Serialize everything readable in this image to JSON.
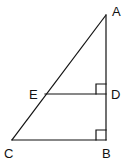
{
  "diagram": {
    "type": "geometry",
    "stroke_color": "#111111",
    "background_color": "#ffffff",
    "points": {
      "A": {
        "label": "A",
        "x": 106,
        "y": 15
      },
      "B": {
        "label": "B",
        "x": 106,
        "y": 140
      },
      "C": {
        "label": "C",
        "x": 12,
        "y": 140
      },
      "D": {
        "label": "D",
        "x": 106,
        "y": 94
      },
      "E": {
        "label": "E",
        "x": 45,
        "y": 94
      }
    },
    "segments": [
      {
        "from": "A",
        "to": "C"
      },
      {
        "from": "A",
        "to": "B"
      },
      {
        "from": "C",
        "to": "B"
      },
      {
        "from": "E",
        "to": "D"
      }
    ],
    "right_angles": [
      {
        "at": "D",
        "between": [
          "E",
          "A"
        ]
      },
      {
        "at": "B",
        "between": [
          "C",
          "A"
        ]
      }
    ]
  }
}
